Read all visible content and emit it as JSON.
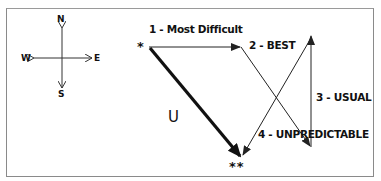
{
  "compass": {
    "north": "N",
    "south": "S",
    "west": "W",
    "east": "E"
  },
  "markers": {
    "start": "*",
    "end": "**"
  },
  "routes": {
    "route_1": "1 - Most Difficult",
    "route_2": "2 - BEST",
    "route_3": "3 - USUAL",
    "route_4": "4 - UNPREDICTABLE",
    "direct": "U"
  },
  "colors": {
    "line": "#222222",
    "border": "#8a8a8a",
    "background": "#ffffff"
  }
}
